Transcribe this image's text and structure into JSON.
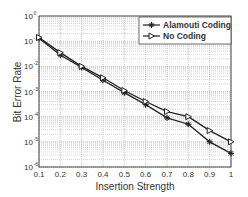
{
  "chart_data": {
    "type": "line",
    "title": "",
    "xlabel": "Insertion Strength",
    "ylabel": "Bit Error Rate",
    "x": [
      0.1,
      0.2,
      0.3,
      0.4,
      0.5,
      0.6,
      0.7,
      0.8,
      0.9,
      1.0
    ],
    "xticks": [
      "0.1",
      "0.2",
      "0.3",
      "0.4",
      "0.5",
      "0.6",
      "0.7",
      "0.8",
      "0.9",
      "1"
    ],
    "yscale": "log",
    "ylim": [
      1e-06,
      1
    ],
    "yticks_exp": [
      0,
      -1,
      -2,
      -3,
      -4,
      -5,
      -6
    ],
    "grid": true,
    "legend_position": "upper right",
    "series": [
      {
        "name": "Alamouti Coding",
        "marker": "star",
        "values": [
          0.13,
          0.028,
          0.009,
          0.0028,
          0.0009,
          0.0003,
          9e-05,
          5e-05,
          1e-05,
          3.5e-06
        ]
      },
      {
        "name": "No Coding",
        "marker": "triangle-right",
        "values": [
          0.14,
          0.035,
          0.01,
          0.0035,
          0.0011,
          0.0004,
          0.00016,
          0.0001,
          2.8e-05,
          1e-05
        ]
      }
    ]
  },
  "legend": {
    "items": [
      "Alamouti Coding",
      "No Coding"
    ]
  },
  "axes": {
    "xlabel": "Insertion Strength",
    "ylabel": "Bit Error Rate",
    "ytick_base": "10"
  }
}
